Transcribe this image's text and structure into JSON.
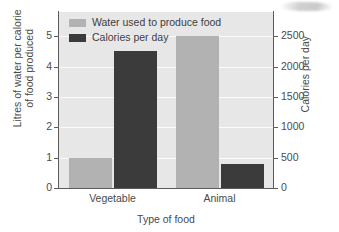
{
  "chart_data": {
    "type": "bar",
    "title": "",
    "categories": [
      "Vegetable",
      "Animal"
    ],
    "xlabel": "Type of food",
    "series": [
      {
        "name": "Water used to produce food",
        "axis": "left",
        "color": "#b2b2b2",
        "values": [
          1,
          5
        ]
      },
      {
        "name": "Calories per day",
        "axis": "right",
        "color": "#3b3b3b",
        "values": [
          2250,
          400
        ]
      }
    ],
    "left_axis": {
      "label": "Litres of water per calorie\nof food produced",
      "ticks": [
        0,
        1,
        2,
        3,
        4,
        5
      ],
      "tick_labels": [
        "0",
        "1",
        "2",
        "3",
        "4",
        "5"
      ],
      "lim": [
        0,
        5.8
      ]
    },
    "right_axis": {
      "label": "Calories per day",
      "ticks": [
        0,
        500,
        1000,
        1500,
        2000,
        2500
      ],
      "tick_labels": [
        "0",
        "500",
        "1000",
        "1500",
        "2000",
        "2500"
      ],
      "lim": [
        0,
        2900
      ]
    },
    "legend": {
      "position": "top-left-inside",
      "entries": [
        {
          "label": "Water used to produce food",
          "color": "#b2b2b2"
        },
        {
          "label": "Calories per day",
          "color": "#3b3b3b"
        }
      ]
    },
    "grid": {
      "horizontal": true,
      "color": "#fbfbfb"
    },
    "plot_background": "#e7e7e7",
    "annotations": []
  }
}
